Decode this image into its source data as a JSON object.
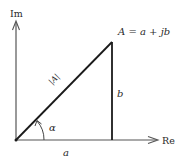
{
  "diagram": {
    "axes": {
      "imaginary_label": "Im",
      "real_label": "Re"
    },
    "labels": {
      "point": "A = a + jb",
      "magnitude": "|A|",
      "angle": "α",
      "real_part": "a",
      "imag_part": "b"
    },
    "colors": {
      "line": "#1a1a1a",
      "axis": "#555555",
      "text": "#2a2a2a"
    }
  }
}
